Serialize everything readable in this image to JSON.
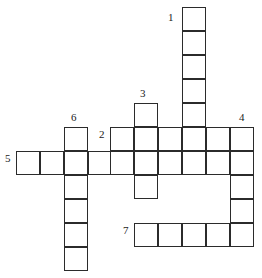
{
  "puzzle": {
    "type": "crossword-grid",
    "title": "Crossword puzzle grid",
    "width": 262,
    "height": 278,
    "cell_size": 24,
    "colors": {
      "cell_fill": "#ffffff",
      "cell_border": "#2b2b2b",
      "number_color": "#1a1a1a",
      "background": "#ffffff"
    },
    "origin": {
      "x": 16,
      "y": 7
    },
    "entries": [
      {
        "number": "1",
        "direction": "down",
        "length": 7,
        "start_col": 7,
        "start_row": 0,
        "label_x": 168,
        "label_y": 12
      },
      {
        "number": "2",
        "direction": "across",
        "length": 6,
        "start_col": 4,
        "start_row": 5,
        "label_x": 99,
        "label_y": 129
      },
      {
        "number": "3",
        "direction": "down",
        "length": 4,
        "start_col": 5,
        "start_row": 4,
        "label_x": 140,
        "label_y": 88
      },
      {
        "number": "4",
        "direction": "down",
        "length": 6,
        "start_col": 9,
        "start_row": 5,
        "label_x": 239,
        "label_y": 112
      },
      {
        "number": "5",
        "direction": "across",
        "length": 5,
        "start_col": 0,
        "start_row": 6,
        "label_x": 5,
        "label_y": 153
      },
      {
        "number": "6",
        "direction": "down",
        "length": 6,
        "start_col": 2,
        "start_row": 5,
        "label_x": 71,
        "label_y": 112
      },
      {
        "number": "7",
        "direction": "across",
        "length": 5,
        "start_col": 5,
        "start_row": 9,
        "label_x": 123,
        "label_y": 225
      }
    ],
    "cells": [
      {
        "name": "cell-r0c7",
        "x": 182,
        "y": 7
      },
      {
        "name": "cell-r1c7",
        "x": 182,
        "y": 31
      },
      {
        "name": "cell-r2c7",
        "x": 182,
        "y": 55
      },
      {
        "name": "cell-r3c7",
        "x": 182,
        "y": 79
      },
      {
        "name": "cell-r4c7",
        "x": 182,
        "y": 103
      },
      {
        "name": "cell-r5c7",
        "x": 182,
        "y": 127
      },
      {
        "name": "cell-r6c7",
        "x": 182,
        "y": 151
      },
      {
        "name": "cell-r4c5",
        "x": 134,
        "y": 103
      },
      {
        "name": "cell-r5c5",
        "x": 134,
        "y": 127
      },
      {
        "name": "cell-r6c5",
        "x": 134,
        "y": 151
      },
      {
        "name": "cell-r7c5",
        "x": 134,
        "y": 175
      },
      {
        "name": "cell-r5c4",
        "x": 110,
        "y": 127
      },
      {
        "name": "cell-r5c6",
        "x": 158,
        "y": 127
      },
      {
        "name": "cell-r5c8",
        "x": 206,
        "y": 127
      },
      {
        "name": "cell-r5c9",
        "x": 230,
        "y": 127
      },
      {
        "name": "cell-r6c0",
        "x": 16,
        "y": 151
      },
      {
        "name": "cell-r6c1",
        "x": 40,
        "y": 151
      },
      {
        "name": "cell-r6c2",
        "x": 64,
        "y": 151
      },
      {
        "name": "cell-r6c3",
        "x": 88,
        "y": 151
      },
      {
        "name": "cell-r6c4",
        "x": 110,
        "y": 151
      },
      {
        "name": "cell-r6c6",
        "x": 158,
        "y": 151
      },
      {
        "name": "cell-r6c8",
        "x": 206,
        "y": 151
      },
      {
        "name": "cell-r6c9",
        "x": 230,
        "y": 151
      },
      {
        "name": "cell-r5c2",
        "x": 64,
        "y": 127
      },
      {
        "name": "cell-r7c2",
        "x": 64,
        "y": 175
      },
      {
        "name": "cell-r8c2",
        "x": 64,
        "y": 199
      },
      {
        "name": "cell-r9c2",
        "x": 64,
        "y": 223
      },
      {
        "name": "cell-r10c2",
        "x": 64,
        "y": 247
      },
      {
        "name": "cell-r7c9",
        "x": 230,
        "y": 175
      },
      {
        "name": "cell-r8c9",
        "x": 230,
        "y": 199
      },
      {
        "name": "cell-r9c9",
        "x": 230,
        "y": 223
      },
      {
        "name": "cell-r9c5",
        "x": 134,
        "y": 223
      },
      {
        "name": "cell-r9c6",
        "x": 158,
        "y": 223
      },
      {
        "name": "cell-r9c7",
        "x": 182,
        "y": 223
      },
      {
        "name": "cell-r9c8",
        "x": 206,
        "y": 223
      }
    ]
  }
}
